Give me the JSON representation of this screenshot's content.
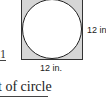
{
  "diagram": {
    "shape": "circle inscribed in square",
    "square_fill": "#d6d6d6",
    "circle_fill": "#ffffff",
    "labels": {
      "side_right": "12 in.",
      "side_bottom": "12 in."
    },
    "fragment_left": "1",
    "caption": "t of circle"
  }
}
